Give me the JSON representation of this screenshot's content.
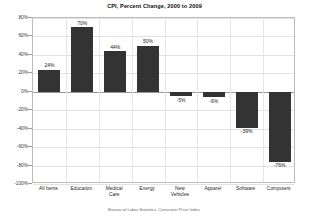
{
  "chart_data": {
    "type": "bar",
    "title": "CPI, Percent Change, 2000 to 2009",
    "xlabel": "",
    "ylabel": "",
    "ylim": [
      -100,
      80
    ],
    "ytick_step": 20,
    "grid": true,
    "legend": "none",
    "categories": [
      "All Items",
      "Education",
      "Medical Care",
      "Energy",
      "New Vehicles",
      "Apparel",
      "Software",
      "Computers"
    ],
    "category_lines": [
      [
        "All Items"
      ],
      [
        "Education"
      ],
      [
        "Medical",
        "Care"
      ],
      [
        "Energy"
      ],
      [
        "New",
        "Vehicles"
      ],
      [
        "Apparel"
      ],
      [
        "Software"
      ],
      [
        "Computers"
      ]
    ],
    "values": [
      24,
      70,
      44,
      50,
      -5,
      -6,
      -39,
      -76
    ],
    "data_labels": [
      "24%",
      "70%",
      "44%",
      "50%",
      "-5%",
      "-6%",
      "-39%",
      "-76%"
    ],
    "ytick_labels": [
      "80%",
      "60%",
      "40%",
      "20%",
      "0%",
      "-20%",
      "-40%",
      "-60%",
      "-80%",
      "-100%"
    ],
    "ytick_values": [
      80,
      60,
      40,
      20,
      0,
      -20,
      -40,
      -60,
      -80,
      -100
    ],
    "bar_color": "#333333",
    "plot_background": "#ffffff",
    "grid_color": "#e2e2e2",
    "axis_color": "#9a9a9a",
    "source_note": "Bureau of Labor Statistics, Consumer Price Index."
  }
}
